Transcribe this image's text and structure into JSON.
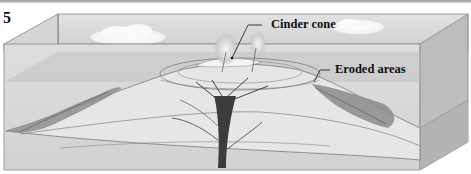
{
  "figure": {
    "number": "5",
    "labels": {
      "cinder_cone": "Cinder cone",
      "eroded_areas": "Eroded areas"
    }
  }
}
